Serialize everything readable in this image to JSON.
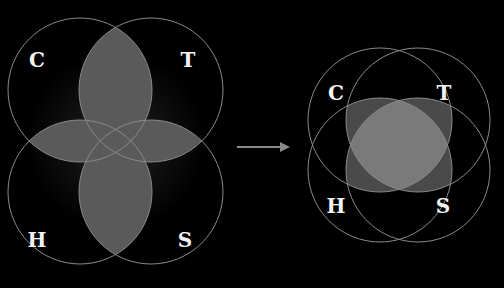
{
  "diagram": {
    "before": {
      "labels": {
        "top_left": "C",
        "top_right": "T",
        "bottom_left": "H",
        "bottom_right": "S"
      }
    },
    "arrow": "right-arrow",
    "after": {
      "labels": {
        "top_left": "C",
        "top_right": "T",
        "bottom_left": "H",
        "bottom_right": "S"
      }
    },
    "colors": {
      "background": "#000000",
      "stroke": "#8a8a8a",
      "overlap": "#6e6e6e",
      "label": "#f2f2f2"
    }
  }
}
